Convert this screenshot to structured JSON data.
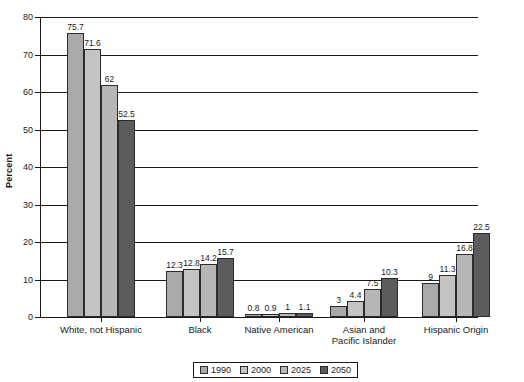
{
  "chart_data": {
    "type": "bar",
    "title": "",
    "xlabel": "",
    "ylabel": "Percent",
    "ylim": [
      0,
      80
    ],
    "ytick_step": 10,
    "yticks": [
      "0",
      "10",
      "20",
      "30",
      "40",
      "50",
      "60",
      "70",
      "80"
    ],
    "grid": true,
    "grid_axis": "y",
    "legend_position": "bottom-center",
    "categories": [
      "White, not Hispanic",
      "Black",
      "Native American",
      "Asian and\nPacific Islander",
      "Hispanic Origin"
    ],
    "series": [
      {
        "name": "1990",
        "color": "#a9a9a9",
        "values": [
          75.7,
          12.3,
          0.8,
          3,
          9
        ],
        "labels": [
          "75.7",
          "12.3",
          "0.8",
          "3",
          "9"
        ]
      },
      {
        "name": "2000",
        "color": "#c4c4c4",
        "values": [
          71.6,
          12.8,
          0.9,
          4.4,
          11.3
        ],
        "labels": [
          "71.6",
          "12.8",
          "0.9",
          "4.4",
          "11.3"
        ]
      },
      {
        "name": "2025",
        "color": "#b6b6b6",
        "values": [
          62,
          14.2,
          1,
          7.5,
          16.8
        ],
        "labels": [
          "62",
          "14.2",
          "1",
          "7.5",
          "16.8"
        ]
      },
      {
        "name": "2050",
        "color": "#5c5c5c",
        "values": [
          52.5,
          15.7,
          1.1,
          10.3,
          22.5
        ],
        "labels": [
          "52.5",
          "15.7",
          "1.1",
          "10.3",
          "22.5"
        ]
      }
    ]
  }
}
